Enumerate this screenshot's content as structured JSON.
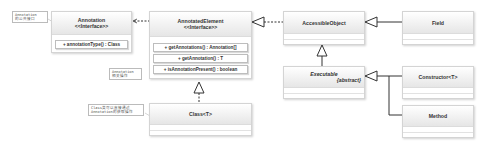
{
  "diagram": {
    "type": "UML class diagram",
    "classes": {
      "annotation": {
        "name": "Annotation",
        "stereotype": "<<Interface>>",
        "methods": [
          "+ annotationType() : Class"
        ]
      },
      "annotated_element": {
        "name": "AnnotatedElement",
        "stereotype": "<<Interface>>",
        "methods": [
          "+ getAnnotations() : Annotation[]",
          "+ getAnnotation() : T",
          "+ isAnnotationPresent() : boolean"
        ]
      },
      "accessible_object": {
        "name": "AccessibleObject"
      },
      "field": {
        "name": "Field"
      },
      "executable": {
        "name": "Executable",
        "modifier": "{abstract}"
      },
      "constructor": {
        "name": "Constructor<T>"
      },
      "method": {
        "name": "Method"
      },
      "class_t": {
        "name": "Class<T>"
      }
    },
    "notes": [
      {
        "line1": "Annotation",
        "line2": "的公共接口"
      },
      {
        "line1": "Annotation",
        "line2": "相关操作"
      },
      {
        "line1": "Class类可以直接通过",
        "line2": "Annotation的获取操作"
      }
    ],
    "relationships": [
      {
        "from": "AnnotatedElement",
        "to": "Annotation",
        "type": "dependency"
      },
      {
        "from": "AccessibleObject",
        "to": "AnnotatedElement",
        "type": "realization"
      },
      {
        "from": "Field",
        "to": "AccessibleObject",
        "type": "generalization"
      },
      {
        "from": "Executable",
        "to": "AccessibleObject",
        "type": "generalization"
      },
      {
        "from": "Constructor<T>",
        "to": "Executable",
        "type": "generalization"
      },
      {
        "from": "Method",
        "to": "Executable",
        "type": "generalization"
      },
      {
        "from": "Class<T>",
        "to": "AnnotatedElement",
        "type": "realization"
      }
    ]
  }
}
